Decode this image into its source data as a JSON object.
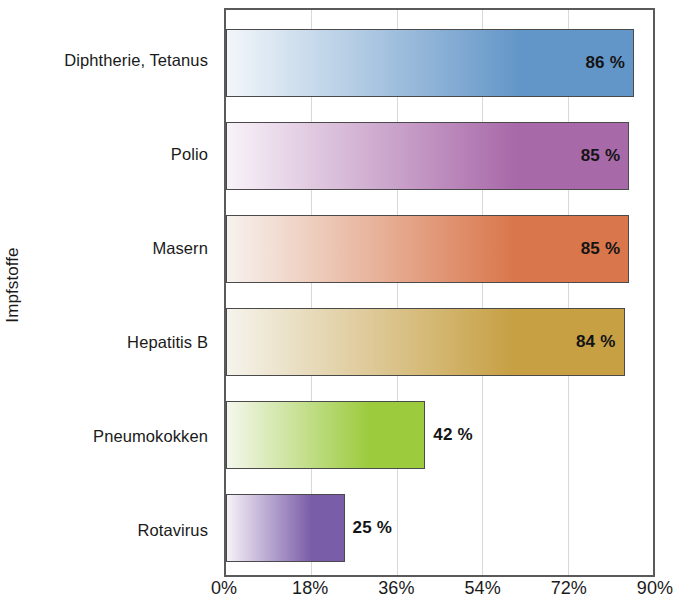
{
  "chart_data": {
    "type": "bar",
    "orientation": "horizontal",
    "title": "",
    "xlabel": "",
    "ylabel": "Impfstoffe",
    "categories": [
      "Diphtherie, Tetanus",
      "Polio",
      "Masern",
      "Hepatitis B",
      "Pneumokokken",
      "Rotavirus"
    ],
    "values": [
      86,
      85,
      85,
      84,
      42,
      25
    ],
    "value_labels": [
      "86 %",
      "85 %",
      "85 %",
      "84 %",
      "42 %",
      "25 %"
    ],
    "value_label_position": [
      "inside",
      "inside",
      "inside",
      "inside",
      "outside",
      "outside"
    ],
    "xlim": [
      0,
      90
    ],
    "xticks": [
      0,
      18,
      36,
      54,
      72,
      90
    ],
    "xtick_labels": [
      "0%",
      "18%",
      "36%",
      "54%",
      "72%",
      "90%"
    ],
    "grid": "vertical",
    "legend": "none",
    "bar_colors_end": [
      "#6396c8",
      "#a869a9",
      "#d9764b",
      "#c7a044",
      "#9ccb3e",
      "#7a5da8"
    ],
    "bar_colors_start": [
      "#f2f6fa",
      "#f8f2f8",
      "#f7f2ee",
      "#f5f3ec",
      "#f4f7ec",
      "#f6f1f8"
    ],
    "axis_color": "#5a5a5a",
    "gridline_color": "#d8d8d8",
    "series": [
      {
        "name": "Impfquote",
        "points": [
          {
            "category": "Diphtherie, Tetanus",
            "value": 86,
            "label": "86 %",
            "color": "#6396c8"
          },
          {
            "category": "Polio",
            "value": 85,
            "label": "85 %",
            "color": "#a869a9"
          },
          {
            "category": "Masern",
            "value": 85,
            "label": "85 %",
            "color": "#d9764b"
          },
          {
            "category": "Hepatitis B",
            "value": 84,
            "label": "84 %",
            "color": "#c7a044"
          },
          {
            "category": "Pneumokokken",
            "value": 42,
            "label": "42 %",
            "color": "#9ccb3e"
          },
          {
            "category": "Rotavirus",
            "value": 25,
            "label": "25 %",
            "color": "#7a5da8"
          }
        ]
      }
    ]
  }
}
